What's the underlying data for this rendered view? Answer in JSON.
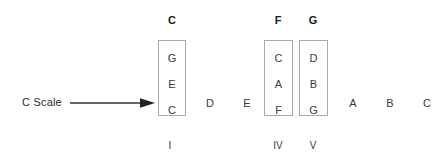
{
  "diagram": {
    "scale_label": "C Scale",
    "arrow_icon": "right-arrow-icon",
    "scale_notes": [
      {
        "label": "C",
        "x": 164,
        "boxed": true
      },
      {
        "label": "D",
        "x": 202,
        "boxed": false
      },
      {
        "label": "E",
        "x": 239,
        "boxed": false
      },
      {
        "label": "F",
        "x": 271,
        "boxed": true
      },
      {
        "label": "G",
        "x": 306,
        "boxed": true
      },
      {
        "label": "A",
        "x": 345,
        "boxed": false
      },
      {
        "label": "B",
        "x": 382,
        "boxed": false
      },
      {
        "label": "C",
        "x": 419,
        "boxed": false
      }
    ],
    "chords": [
      {
        "name": "C",
        "numeral": "I",
        "tones": [
          "G",
          "E",
          "C"
        ],
        "box_left": 158,
        "box_top": 40,
        "box_width": 28,
        "box_height": 76,
        "head_left": 157,
        "numeral_left": 158
      },
      {
        "name": "F",
        "numeral": "IV",
        "tones": [
          "C",
          "A",
          "F"
        ],
        "box_left": 264,
        "box_top": 40,
        "box_width": 29,
        "box_height": 76,
        "head_left": 263,
        "numeral_left": 266
      },
      {
        "name": "G",
        "numeral": "V",
        "tones": [
          "D",
          "B",
          "G"
        ],
        "box_left": 299,
        "box_top": 40,
        "box_width": 29,
        "box_height": 76,
        "head_left": 298,
        "numeral_left": 301
      }
    ],
    "colors": {
      "background": "#ffffff",
      "box_border": "#a9a9a9",
      "tone_text": "#3a3a3a",
      "header_text": "#1a1a1a",
      "arrow": "#333333"
    }
  }
}
